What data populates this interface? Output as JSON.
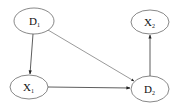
{
  "diagram": {
    "type": "directed-graph",
    "nodes": [
      {
        "id": "D1",
        "label": "D",
        "sub": "1",
        "cx": 34,
        "cy": 21,
        "rx": 20,
        "ry": 13
      },
      {
        "id": "X2",
        "label": "X",
        "sub": "2",
        "cx": 150,
        "cy": 22,
        "rx": 19,
        "ry": 12
      },
      {
        "id": "X1",
        "label": "X",
        "sub": "1",
        "cx": 29,
        "cy": 87,
        "rx": 19,
        "ry": 12
      },
      {
        "id": "D2",
        "label": "D",
        "sub": "2",
        "cx": 150,
        "cy": 89,
        "rx": 19,
        "ry": 13
      }
    ],
    "edges": [
      {
        "from": "D1",
        "to": "X1"
      },
      {
        "from": "D1",
        "to": "D2"
      },
      {
        "from": "X1",
        "to": "D2"
      },
      {
        "from": "D2",
        "to": "X2"
      }
    ],
    "colors": {
      "stroke": "#444444",
      "edge": "#333333",
      "background": "#ffffff"
    }
  }
}
